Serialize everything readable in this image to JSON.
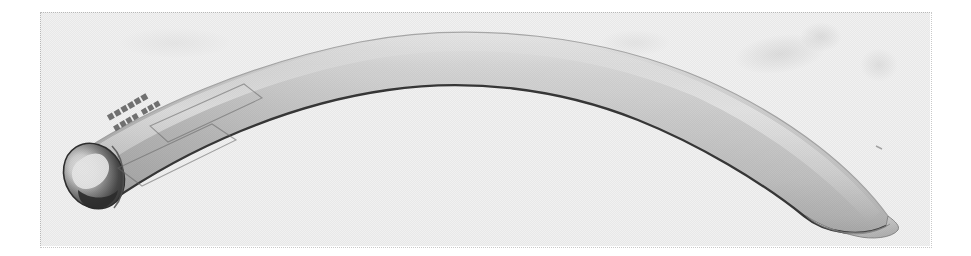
{
  "figure": {
    "kind": "photograph",
    "orientation": "arc opening downward, left end capped, right end cut at an angle",
    "rendering": "grayscale halftone scan",
    "background_color": "#ffffff",
    "frame": {
      "style": "dotted",
      "color": "#c9c9c9",
      "left": 40,
      "top": 12,
      "width": 892,
      "height": 236
    },
    "tube": {
      "body_color_light": "#e6e6e6",
      "body_color_mid": "#c4c4c4",
      "body_color_shadow": "#9a9a9a",
      "edge_line_color": "#3a3a3a",
      "end_cap_dark_color": "#3d3d3d",
      "end_cap_highlight_color": "#f2f2f2",
      "left_end_x": 70,
      "left_end_y": 178,
      "apex_x": 520,
      "apex_y": 56,
      "right_end_x": 880,
      "right_end_y": 215
    },
    "label_on_tube": {
      "legible": false,
      "line_1": "■■■■ ■■■",
      "line_2": "■■■■■■",
      "note": "printed marking near the left end, rotated along the tube axis, illegible in the scan"
    },
    "artifacts": [
      {
        "name": "smudge-upper-right-a"
      },
      {
        "name": "smudge-upper-right-b"
      },
      {
        "name": "smudge-upper-right-c"
      },
      {
        "name": "smudge-upper-mid"
      },
      {
        "name": "smudge-left-top"
      }
    ],
    "caption": ""
  }
}
